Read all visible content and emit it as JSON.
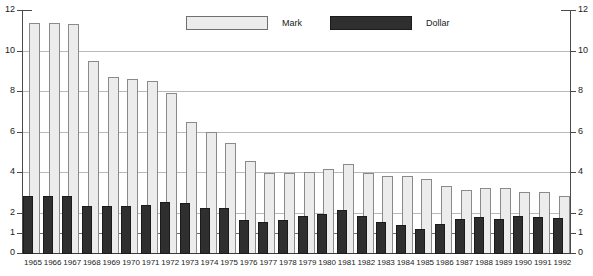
{
  "chart_data": {
    "type": "bar",
    "title": "",
    "subtitle": "",
    "xlabel": "",
    "ylabel": "",
    "ylim": [
      0,
      12
    ],
    "grid": true,
    "legend_position": "top-center",
    "y_ticks": [
      0,
      1,
      2,
      4,
      6,
      8,
      10,
      12
    ],
    "y_ticks_right": [
      0,
      1,
      2,
      4,
      6,
      8,
      10,
      12
    ],
    "gridlines_at": [
      1,
      2,
      4,
      6,
      8,
      10
    ],
    "categories": [
      "1965",
      "1966",
      "1967",
      "1968",
      "1969",
      "1970",
      "1971",
      "1972",
      "1973",
      "1974",
      "1975",
      "1976",
      "1977",
      "1978",
      "1979",
      "1980",
      "1981",
      "1982",
      "1983",
      "1984",
      "1985",
      "1986",
      "1987",
      "1988",
      "1989",
      "1990",
      "1991",
      "1992"
    ],
    "series": [
      {
        "name": "Mark",
        "color": "#ececec",
        "values": [
          11.4,
          11.4,
          11.35,
          9.55,
          8.75,
          8.65,
          8.55,
          7.95,
          6.5,
          6.05,
          5.5,
          4.6,
          4.0,
          4.0,
          4.05,
          4.2,
          4.45,
          4.0,
          3.85,
          3.85,
          3.7,
          3.35,
          3.15,
          3.25,
          3.25,
          3.05,
          3.05,
          2.85
        ]
      },
      {
        "name": "Dollar",
        "color": "#2f2f2f",
        "values": [
          2.85,
          2.85,
          2.85,
          2.35,
          2.35,
          2.35,
          2.4,
          2.55,
          2.5,
          2.25,
          2.25,
          1.7,
          1.6,
          1.7,
          1.9,
          2.0,
          2.15,
          1.9,
          1.6,
          1.45,
          1.25,
          1.5,
          1.75,
          1.85,
          1.75,
          1.9,
          1.85,
          1.8
        ]
      }
    ]
  },
  "legend": {
    "items": [
      {
        "label": "Mark",
        "swatch": "mark-swatch"
      },
      {
        "label": "Dollar",
        "swatch": "dollar-swatch"
      }
    ]
  }
}
